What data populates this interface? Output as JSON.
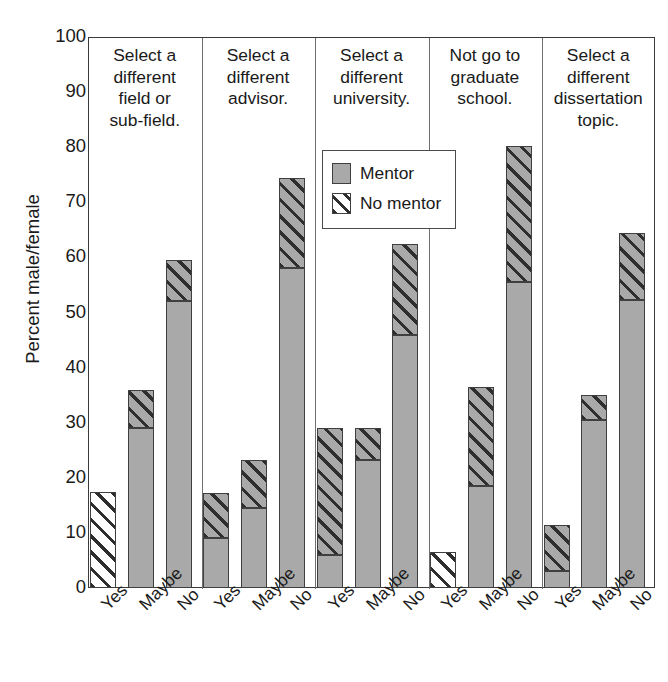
{
  "chart_data": {
    "type": "bar",
    "subtype": "stacked-grouped-panel",
    "title": "",
    "xlabel": "",
    "ylabel": "Percent male/female",
    "ylim": [
      0,
      100
    ],
    "ytick_labels": [
      "100",
      "90",
      "80",
      "70",
      "60",
      "50",
      "40",
      "30",
      "20",
      "10",
      "0"
    ],
    "ytick_values": [
      100,
      90,
      80,
      70,
      60,
      50,
      40,
      30,
      20,
      10,
      0
    ],
    "grid": false,
    "legend_position": "inside-upper-center",
    "categories": [
      "Yes",
      "Maybe",
      "No"
    ],
    "series": [
      {
        "name": "Mentor",
        "color": "#a9a9a9",
        "pattern": "solid"
      },
      {
        "name": "No mentor",
        "color": "#ffffff",
        "pattern": "diagonal-hatch"
      }
    ],
    "panels": [
      {
        "caption": "Select a different field or sub-field.",
        "caption_lines": [
          "Select a",
          "different",
          "field or",
          "sub-field."
        ],
        "bars": [
          {
            "category": "Yes",
            "mentor": 0.0,
            "no_mentor": 17.5,
            "total": 17.5
          },
          {
            "category": "Maybe",
            "mentor": 29.0,
            "no_mentor": 7.0,
            "total": 36.0
          },
          {
            "category": "No",
            "mentor": 52.0,
            "no_mentor": 7.5,
            "total": 59.5
          }
        ]
      },
      {
        "caption": "Select a different advisor.",
        "caption_lines": [
          "Select a",
          "different",
          "advisor."
        ],
        "bars": [
          {
            "category": "Yes",
            "mentor": 9.0,
            "no_mentor": 8.3,
            "total": 17.3
          },
          {
            "category": "Maybe",
            "mentor": 14.5,
            "no_mentor": 8.8,
            "total": 23.3
          },
          {
            "category": "No",
            "mentor": 58.0,
            "no_mentor": 16.5,
            "total": 74.5
          }
        ]
      },
      {
        "caption": "Select a different university.",
        "caption_lines": [
          "Select a",
          "different",
          "university."
        ],
        "bars": [
          {
            "category": "Yes",
            "mentor": 6.0,
            "no_mentor": 23.0,
            "total": 29.0
          },
          {
            "category": "Maybe",
            "mentor": 23.3,
            "no_mentor": 5.7,
            "total": 29.0
          },
          {
            "category": "No",
            "mentor": 46.0,
            "no_mentor": 16.5,
            "total": 62.5
          }
        ]
      },
      {
        "caption": "Not go to graduate school.",
        "caption_lines": [
          "Not go to",
          "graduate",
          "school."
        ],
        "bars": [
          {
            "category": "Yes",
            "mentor": 0.0,
            "no_mentor": 6.5,
            "total": 6.5
          },
          {
            "category": "Maybe",
            "mentor": 18.5,
            "no_mentor": 18.0,
            "total": 36.5
          },
          {
            "category": "No",
            "mentor": 55.5,
            "no_mentor": 24.8,
            "total": 80.3
          }
        ]
      },
      {
        "caption": "Select a different dissertation topic.",
        "caption_lines": [
          "Select a",
          "different",
          "dissertation",
          "topic."
        ],
        "bars": [
          {
            "category": "Yes",
            "mentor": 3.0,
            "no_mentor": 8.5,
            "total": 11.5
          },
          {
            "category": "Maybe",
            "mentor": 30.5,
            "no_mentor": 4.5,
            "total": 35.0
          },
          {
            "category": "No",
            "mentor": 52.3,
            "no_mentor": 12.2,
            "total": 64.5
          }
        ]
      }
    ]
  },
  "legend": {
    "items": [
      {
        "label": "Mentor",
        "icon": "gray-square-swatch"
      },
      {
        "label": "No mentor",
        "icon": "hatched-square-swatch"
      }
    ]
  },
  "axis": {
    "y_title": "Percent male/female"
  }
}
